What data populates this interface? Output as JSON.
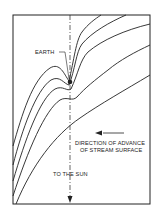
{
  "diagram": {
    "labels": {
      "earth": "EARTH",
      "direction_line1": "DIRECTION OF ADVANCE",
      "direction_line2": "OF STREAM SURFACE",
      "sun": "TO THE SUN"
    },
    "colors": {
      "line": "#222222",
      "background": "#ffffff"
    },
    "stream_lines_count": 5
  }
}
